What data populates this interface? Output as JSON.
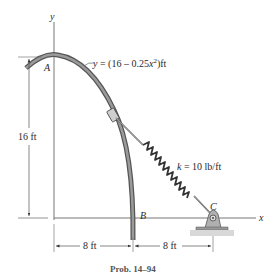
{
  "figure": {
    "axis_y_label": "y",
    "axis_x_label": "x",
    "point_a": "A",
    "point_b": "B",
    "point_c": "C",
    "curve_equation": {
      "prefix": "y = (16 – 0.25",
      "var": "x",
      "exp": "2",
      "suffix": ")ft"
    },
    "spring_label": "k = 10 lb/ft",
    "dim_height": "16 ft",
    "dim_left": "8 ft",
    "dim_right": "8 ft",
    "caption": "Prob. 14–94"
  }
}
